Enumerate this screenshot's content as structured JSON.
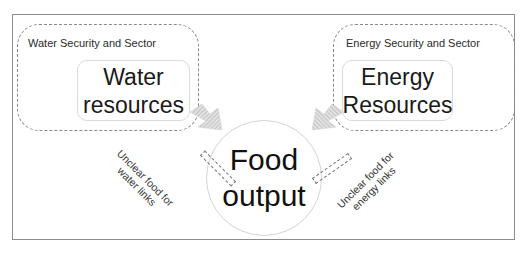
{
  "diagram": {
    "water_sector": {
      "label": "Water Security and Sector",
      "resource_line1": "Water",
      "resource_line2": "resources"
    },
    "energy_sector": {
      "label": "Energy Security and Sector",
      "resource_line1": "Energy",
      "resource_line2": "Resources"
    },
    "food": {
      "line1": "Food",
      "line2": "output"
    },
    "links": {
      "water_line1": "Unclear food for",
      "water_line2": "water links",
      "energy_line1": "Unclear food for",
      "energy_line2": "energy links"
    },
    "arrows": [
      {
        "from": "water_resources",
        "to": "food_output",
        "style": "striped-gray"
      },
      {
        "from": "energy_resources",
        "to": "food_output",
        "style": "striped-gray"
      }
    ],
    "colors": {
      "frame_border": "#8c8c8c",
      "dashed_border": "#8a8a8a",
      "arrow_fill": "#c8c8c8",
      "text": "#1a1a1a"
    }
  }
}
